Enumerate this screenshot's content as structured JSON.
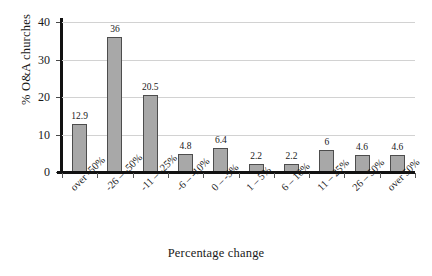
{
  "chart_data": {
    "type": "bar",
    "title": "",
    "xlabel": "Percentage change",
    "ylabel": "% O&A churches",
    "categories": [
      "over -50%",
      "-26 – -50%",
      "-11 – -25%",
      "-6 – -10%",
      "0 – -5%",
      "1 – 5%",
      "6 – 10%",
      "11 – 25%",
      "26 – 50%",
      "over 50%"
    ],
    "values": [
      12.9,
      36,
      20.5,
      4.8,
      6.4,
      2.2,
      2.2,
      6,
      4.6,
      4.6
    ],
    "value_labels": [
      "12.9",
      "36",
      "20.5",
      "4.8",
      "6.4",
      "2.2",
      "2.2",
      "6",
      "4.6",
      "4.6"
    ],
    "ylim": [
      0,
      40
    ],
    "ytick_labels": [
      "40",
      "30",
      "20",
      "10",
      "0"
    ],
    "ytick_values": [
      40,
      30,
      20,
      10,
      0
    ],
    "grid": "horizontal",
    "legend": "none",
    "bar_fill_color": "#a8a8a8",
    "bar_border_color": "#4d4d4d",
    "axis_color": "#111111",
    "gridline_color": "#d2d2d2"
  }
}
